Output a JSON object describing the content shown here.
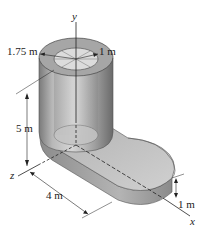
{
  "figure": {
    "type": "3d-isometric-solid",
    "axes": {
      "y": "y",
      "z": "z",
      "x": "x"
    },
    "dimensions": {
      "outer_radius": "1.75 m",
      "inner_radius": "1 m",
      "height": "5 m",
      "length": "4 m",
      "thickness": "1 m"
    },
    "colors": {
      "solid_light": "#d8d8d8",
      "solid_mid": "#a8a8a8",
      "solid_dark": "#6e6e6e",
      "line": "#222222"
    }
  }
}
